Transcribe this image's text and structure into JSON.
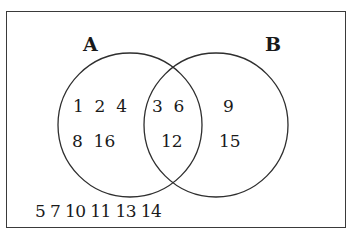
{
  "diagram": {
    "type": "venn",
    "universal_set_outside": "5 7 10 11 13 14",
    "sets": [
      {
        "name": "A",
        "label": "A",
        "only": {
          "row1": "1  2  4",
          "row2": "8  16"
        }
      },
      {
        "name": "B",
        "label": "B",
        "only": {
          "row1": "9",
          "row2": "15"
        }
      }
    ],
    "intersection": {
      "row1": "3  6",
      "row2": "12"
    },
    "elements": {
      "A_only": [
        1,
        2,
        4,
        8,
        16
      ],
      "A_and_B": [
        3,
        6,
        12
      ],
      "B_only": [
        9,
        15
      ],
      "neither": [
        5,
        7,
        10,
        11,
        13,
        14
      ]
    },
    "colors": {
      "stroke": "#2e2e2e",
      "text": "#1a1a1a",
      "background": "#ffffff"
    }
  }
}
